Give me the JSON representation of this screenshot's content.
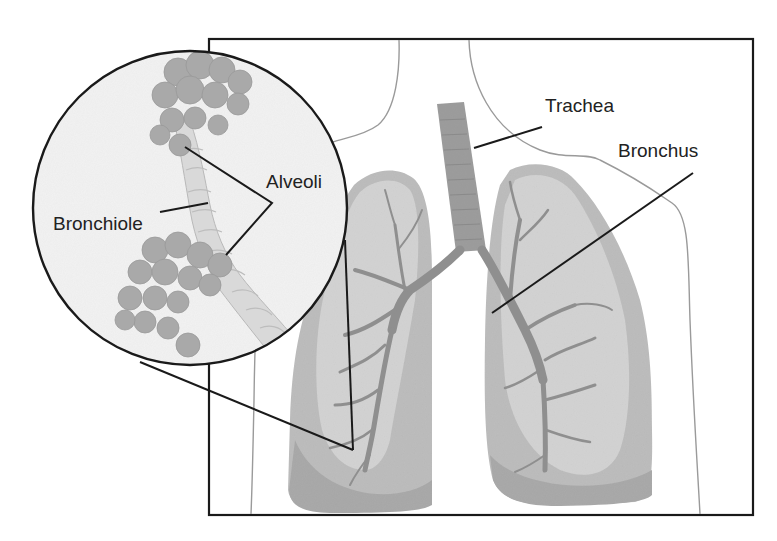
{
  "diagram": {
    "labels": {
      "trachea": "Trachea",
      "bronchus": "Bronchus",
      "alveoli": "Alveoli",
      "bronchiole": "Bronchiole"
    },
    "colors": {
      "outline": "#1a1a1a",
      "body_outline": "#9a9a9a",
      "lung_light": "#cfcfcf",
      "lung_mid": "#b9b9b9",
      "lung_dark": "#a9a9a9",
      "airway": "#8f8f8f",
      "inset_bg": "#f2f2f2",
      "alveoli_cluster": "#a8a8a8",
      "bronchiole_tube": "#d8d8d8"
    }
  }
}
